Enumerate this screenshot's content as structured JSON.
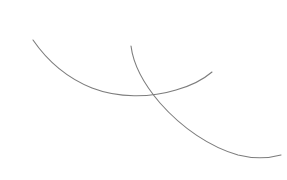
{
  "canvas": {
    "width": 287,
    "height": 180,
    "background_color": "#ffffff",
    "title": ""
  },
  "drawing": {
    "type": "line-drawing",
    "description": "Two thin gray arcs crossing each other",
    "stroke_color": "#808080",
    "stroke_width": 1.1,
    "shape_count": 2,
    "intersection_points": [
      {
        "x": 149,
        "y": 96
      }
    ],
    "shapes": [
      {
        "name": "left-arc",
        "kind": "open-curve",
        "stroke_color": "#7d7d7d",
        "stroke_width": 1.1,
        "start": {
          "x": 33,
          "y": 40
        },
        "end": {
          "x": 212,
          "y": 72
        },
        "lowest_point": {
          "x": 137,
          "y": 97
        },
        "path": "M 33 40 C 44 56, 62 76, 92 88 C 118 98, 150 98, 176 90 C 194 85, 205 78, 212 72"
      },
      {
        "name": "right-arc",
        "kind": "open-curve",
        "stroke_color": "#7d7d7d",
        "stroke_width": 1.1,
        "start": {
          "x": 131,
          "y": 46
        },
        "end": {
          "x": 281,
          "y": 155
        },
        "lowest_point": {
          "x": 250,
          "y": 157
        },
        "path": "M 131 46 C 133 62, 142 82, 160 103 C 182 128, 210 147, 238 155 C 254 159, 270 158, 281 155"
      }
    ]
  }
}
